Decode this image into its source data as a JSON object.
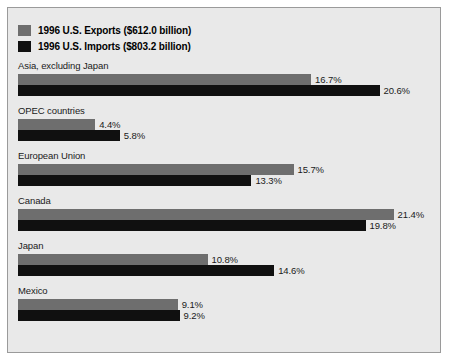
{
  "legend": {
    "items": [
      {
        "label": "1996 U.S. Exports ($612.0 billion)",
        "series": "exports",
        "color": "#6e6e6e"
      },
      {
        "label": "1996 U.S. Imports ($803.2 billion)",
        "series": "imports",
        "color": "#101010"
      }
    ]
  },
  "chart_data": {
    "type": "bar",
    "orientation": "horizontal",
    "title": "",
    "xlabel": "",
    "ylabel": "",
    "grid": false,
    "legend_position": "top-left",
    "value_suffix": "%",
    "xlim": [
      0,
      21.4
    ],
    "categories": [
      "Asia, excluding Japan",
      "OPEC countries",
      "European Union",
      "Canada",
      "Japan",
      "Mexico"
    ],
    "series": [
      {
        "name": "1996 U.S. Exports ($612.0 billion)",
        "color": "#6e6e6e",
        "values": [
          16.7,
          4.4,
          15.7,
          21.4,
          10.8,
          9.1
        ],
        "labels": [
          "16.7%",
          "4.4%",
          "15.7%",
          "21.4%",
          "10.8%",
          "9.1%"
        ]
      },
      {
        "name": "1996 U.S. Imports ($803.2 billion)",
        "color": "#101010",
        "values": [
          20.6,
          5.8,
          13.3,
          19.8,
          14.6,
          9.2
        ],
        "labels": [
          "20.6%",
          "5.8%",
          "13.3%",
          "19.8%",
          "14.6%",
          "9.2%"
        ]
      }
    ]
  },
  "layout": {
    "bar_px_per_percent": 17.55,
    "panel_bg": "#e9e9e9",
    "panel_border": "#9a9a9a"
  }
}
